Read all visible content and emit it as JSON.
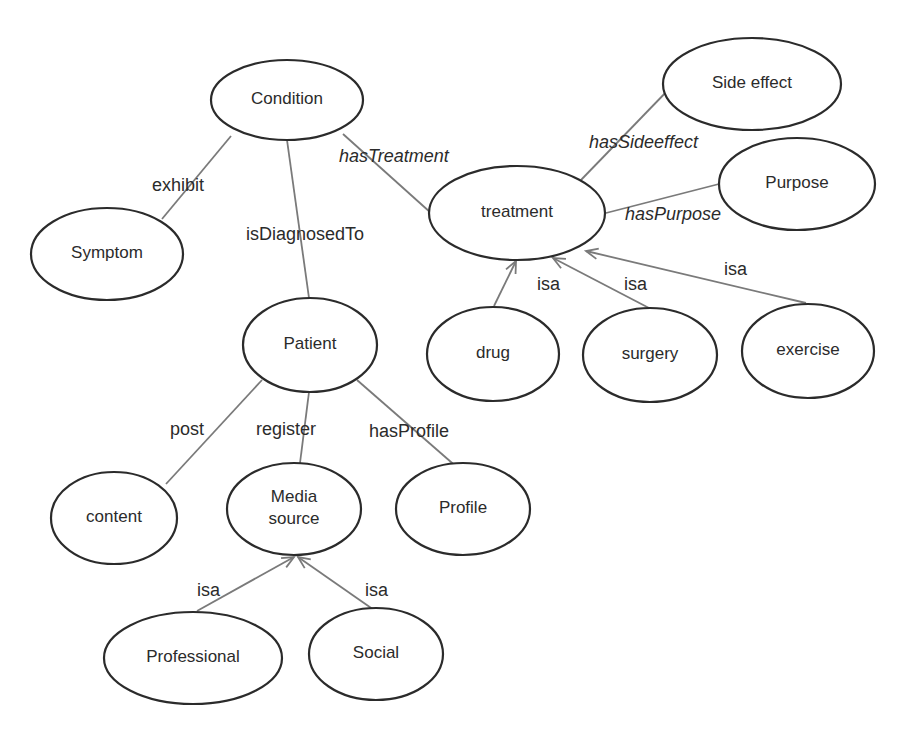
{
  "diagram": {
    "title": "",
    "nodes": [
      {
        "id": "condition",
        "label": "Condition",
        "cx": 287,
        "cy": 100,
        "rx": 76,
        "ry": 40
      },
      {
        "id": "side_effect",
        "label": "Side effect",
        "cx": 752,
        "cy": 84,
        "rx": 89,
        "ry": 46
      },
      {
        "id": "treatment",
        "label": "treatment",
        "cx": 517,
        "cy": 213,
        "rx": 88,
        "ry": 47
      },
      {
        "id": "purpose",
        "label": "Purpose",
        "cx": 797,
        "cy": 184,
        "rx": 78,
        "ry": 46
      },
      {
        "id": "symptom",
        "label": "Symptom",
        "cx": 107,
        "cy": 254,
        "rx": 76,
        "ry": 46
      },
      {
        "id": "patient",
        "label": "Patient",
        "cx": 310,
        "cy": 345,
        "rx": 67,
        "ry": 47
      },
      {
        "id": "drug",
        "label": "drug",
        "cx": 493,
        "cy": 354,
        "rx": 66,
        "ry": 47
      },
      {
        "id": "surgery",
        "label": "surgery",
        "cx": 650,
        "cy": 355,
        "rx": 67,
        "ry": 47
      },
      {
        "id": "exercise",
        "label": "exercise",
        "cx": 808,
        "cy": 351,
        "rx": 66,
        "ry": 47
      },
      {
        "id": "content",
        "label": "content",
        "cx": 114,
        "cy": 518,
        "rx": 63,
        "ry": 46
      },
      {
        "id": "media_source",
        "label_lines": [
          "Media",
          "source"
        ],
        "cx": 294,
        "cy": 509,
        "rx": 67,
        "ry": 46
      },
      {
        "id": "profile",
        "label": "Profile",
        "cx": 463,
        "cy": 509,
        "rx": 67,
        "ry": 46
      },
      {
        "id": "professional",
        "label": "Professional",
        "cx": 193,
        "cy": 658,
        "rx": 89,
        "ry": 46
      },
      {
        "id": "social",
        "label": "Social",
        "cx": 376,
        "cy": 654,
        "rx": 67,
        "ry": 46
      }
    ],
    "edges": [
      {
        "from": "condition",
        "to": "symptom",
        "label": "exhibit",
        "italic": false,
        "arrow": false,
        "x1": 231,
        "y1": 136,
        "x2": 162,
        "y2": 219,
        "lx": 152,
        "ly": 191
      },
      {
        "from": "condition",
        "to": "patient",
        "label": "isDiagnosedTo",
        "italic": false,
        "arrow": false,
        "x1": 287,
        "y1": 140,
        "x2": 309,
        "y2": 298,
        "lx": 246,
        "ly": 240
      },
      {
        "from": "condition",
        "to": "treatment",
        "label": "hasTreatment",
        "italic": true,
        "arrow": false,
        "x1": 343,
        "y1": 134,
        "x2": 431,
        "y2": 213,
        "lx": 339,
        "ly": 162
      },
      {
        "from": "treatment",
        "to": "side_effect",
        "label": "hasSideeffect",
        "italic": true,
        "arrow": false,
        "x1": 581,
        "y1": 180,
        "x2": 671,
        "y2": 87,
        "lx": 589,
        "ly": 148
      },
      {
        "from": "treatment",
        "to": "purpose",
        "label": "hasPurpose",
        "italic": true,
        "arrow": false,
        "x1": 606,
        "y1": 213,
        "x2": 719,
        "y2": 184,
        "lx": 625,
        "ly": 220
      },
      {
        "from": "drug",
        "to": "treatment",
        "label": "isa",
        "italic": false,
        "arrow": true,
        "x1": 494,
        "y1": 306,
        "x2": 516,
        "y2": 261,
        "lx": 537,
        "ly": 290
      },
      {
        "from": "surgery",
        "to": "treatment",
        "label": "isa",
        "italic": false,
        "arrow": true,
        "x1": 649,
        "y1": 308,
        "x2": 553,
        "y2": 258,
        "lx": 624,
        "ly": 290
      },
      {
        "from": "exercise",
        "to": "treatment",
        "label": "isa",
        "italic": false,
        "arrow": true,
        "x1": 806,
        "y1": 303,
        "x2": 586,
        "y2": 251,
        "lx": 724,
        "ly": 275
      },
      {
        "from": "patient",
        "to": "content",
        "label": "post",
        "italic": false,
        "arrow": false,
        "x1": 262,
        "y1": 380,
        "x2": 166,
        "y2": 484,
        "lx": 170,
        "ly": 435
      },
      {
        "from": "patient",
        "to": "media_source",
        "label": "register",
        "italic": false,
        "arrow": false,
        "x1": 309,
        "y1": 392,
        "x2": 300,
        "y2": 463,
        "lx": 256,
        "ly": 435
      },
      {
        "from": "patient",
        "to": "profile",
        "label": "hasProfile",
        "italic": false,
        "arrow": false,
        "x1": 357,
        "y1": 380,
        "x2": 459,
        "y2": 469,
        "lx": 369,
        "ly": 437
      },
      {
        "from": "professional",
        "to": "media_source",
        "label": "isa",
        "italic": false,
        "arrow": true,
        "x1": 197,
        "y1": 611,
        "x2": 294,
        "y2": 557,
        "lx": 197,
        "ly": 596
      },
      {
        "from": "social",
        "to": "media_source",
        "label": "isa",
        "italic": false,
        "arrow": true,
        "x1": 374,
        "y1": 610,
        "x2": 298,
        "y2": 557,
        "lx": 365,
        "ly": 596
      }
    ]
  }
}
